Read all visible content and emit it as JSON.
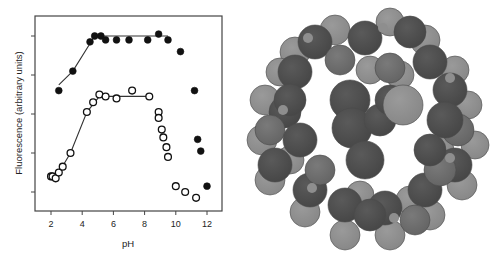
{
  "chart_data": {
    "type": "scatter",
    "title": "",
    "xlabel": "pH",
    "ylabel": "Fluorescence (arbitrary units)",
    "xlim": [
      1.2,
      13.0
    ],
    "ylim": [
      0.5,
      5.5
    ],
    "x_ticks": [
      2,
      4,
      6,
      8,
      10,
      12
    ],
    "y_ticks": [
      1,
      2,
      3,
      4,
      5
    ],
    "y_tick_labels_shown": false,
    "grid": false,
    "legend": null,
    "series": [
      {
        "name": "filled circles",
        "marker": "filled-circle",
        "points": [
          [
            2.5,
            3.6
          ],
          [
            3.4,
            4.1
          ],
          [
            4.5,
            4.85
          ],
          [
            4.8,
            5.0
          ],
          [
            5.2,
            5.0
          ],
          [
            5.5,
            4.9
          ],
          [
            6.2,
            4.9
          ],
          [
            7.0,
            4.9
          ],
          [
            8.2,
            4.9
          ],
          [
            8.9,
            5.05
          ],
          [
            9.5,
            4.9
          ],
          [
            10.3,
            4.6
          ],
          [
            11.2,
            3.6
          ],
          [
            11.4,
            2.35
          ],
          [
            11.6,
            2.05
          ],
          [
            12.0,
            1.15
          ]
        ],
        "fit_line": [
          [
            2.5,
            3.75
          ],
          [
            3.4,
            4.1
          ],
          [
            4.8,
            5.0
          ],
          [
            9.5,
            5.0
          ]
        ]
      },
      {
        "name": "open circles",
        "marker": "open-circle",
        "points": [
          [
            2.0,
            1.4
          ],
          [
            2.1,
            1.4
          ],
          [
            2.3,
            1.35
          ],
          [
            2.5,
            1.5
          ],
          [
            2.75,
            1.65
          ],
          [
            3.25,
            2.0
          ],
          [
            4.3,
            3.05
          ],
          [
            4.7,
            3.3
          ],
          [
            5.1,
            3.5
          ],
          [
            5.5,
            3.45
          ],
          [
            6.2,
            3.4
          ],
          [
            7.2,
            3.6
          ],
          [
            8.3,
            3.45
          ],
          [
            8.9,
            3.05
          ],
          [
            8.9,
            2.9
          ],
          [
            9.1,
            2.6
          ],
          [
            9.2,
            2.4
          ],
          [
            9.4,
            2.15
          ],
          [
            9.5,
            1.9
          ],
          [
            10.0,
            1.15
          ],
          [
            10.6,
            1.0
          ],
          [
            11.3,
            0.85
          ]
        ],
        "fit_line": [
          [
            2.0,
            1.4
          ],
          [
            2.5,
            1.5
          ],
          [
            3.25,
            2.0
          ],
          [
            4.3,
            3.05
          ],
          [
            5.1,
            3.45
          ],
          [
            8.3,
            3.45
          ]
        ]
      }
    ]
  },
  "figure": {
    "left_panel": "fluorescence-vs-ph-plot",
    "right_panel": "space-filling-molecular-model-ring"
  }
}
